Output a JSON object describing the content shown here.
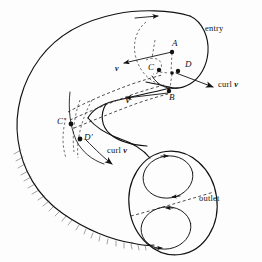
{
  "figure": {
    "background_color": "#fdfdfd",
    "ink_color": "#111111"
  },
  "labels": {
    "entry": "entry",
    "outlet": "outlet",
    "point_a": "A",
    "point_b": "B",
    "point_c_inner": "C",
    "point_d_inner": "D",
    "point_c_left": "C",
    "point_d_left": "D",
    "prime_mark": "′",
    "curl_right": "curl",
    "curl_left": "curl",
    "velocity_upper": "v",
    "velocity_lower": "v",
    "velocity_mid": "v",
    "vector_symbol": "v"
  },
  "annotations": [
    {
      "name": "entry-label",
      "text": "entry"
    },
    {
      "name": "outlet-label",
      "text": "outlet"
    },
    {
      "name": "curl-v-right",
      "text": "curl v"
    },
    {
      "name": "curl-v-left",
      "text": "curl v"
    },
    {
      "name": "velocity-label-upper",
      "text": "v"
    },
    {
      "name": "velocity-label-lower",
      "text": "v"
    },
    {
      "name": "velocity-label-middle",
      "text": "v"
    },
    {
      "name": "vertex-a",
      "text": "A"
    },
    {
      "name": "vertex-b",
      "text": "B"
    },
    {
      "name": "vertex-c",
      "text": "C"
    },
    {
      "name": "vertex-d",
      "text": "D"
    },
    {
      "name": "vertex-c-prime",
      "text": "C′"
    },
    {
      "name": "vertex-d-prime",
      "text": "D′"
    }
  ]
}
